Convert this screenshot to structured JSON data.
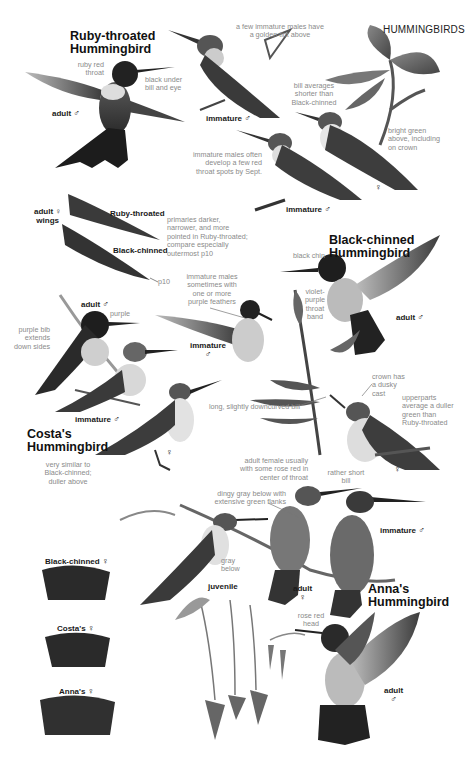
{
  "page": {
    "header": "HUMMINGBIRDS"
  },
  "species": {
    "ruby_throated": {
      "title_line1": "Ruby-throated",
      "title_line2": "Hummingbird",
      "adult_male": {
        "label": "adult",
        "sex": "♂"
      },
      "immature_male_top": {
        "label": "immature",
        "sex": "♂"
      },
      "immature_male_mid": {
        "label": "immature",
        "sex": "♂"
      },
      "female": {
        "sex": "♀"
      },
      "notes": {
        "ruby_red_throat": [
          "ruby red",
          "throat"
        ],
        "black_under_bill": [
          "black under",
          "bill and eye"
        ],
        "golden_tint": [
          "a few immature males have",
          "a golden tint above"
        ],
        "bill_shorter": [
          "bill averages",
          "shorter than",
          "Black-chinned"
        ],
        "bright_green": [
          "bright green",
          "above, including",
          "on crown"
        ],
        "red_spots": [
          "immature males often",
          "develop a few red",
          "throat spots by Sept."
        ]
      }
    },
    "wings": {
      "label_line1": "adult ♀",
      "label_line2": "wings",
      "ruby_label": "Ruby-throated",
      "black_label": "Black-chinned",
      "p10": "p10",
      "note": [
        "primaries darker,",
        "narrower, and more",
        "pointed in Ruby-throated;",
        "compare especially",
        "outermost p10"
      ]
    },
    "black_chinned": {
      "title_line1": "Black-chinned",
      "title_line2": "Hummingbird",
      "adult_male": {
        "label": "adult",
        "sex": "♂"
      },
      "immature_male": {
        "label": "immature",
        "sex": "♂"
      },
      "female": {
        "sex": "♀"
      },
      "notes": {
        "black_chin": "black chin",
        "violet_band": [
          "violet-",
          "purple",
          "throat",
          "band"
        ],
        "purple_feathers": [
          "immature males",
          "sometimes with",
          "one or more",
          "purple feathers"
        ],
        "downcurved_bill": "long, slightly downcurved bill",
        "crown_dusky": [
          "crown has",
          "a dusky",
          "cast"
        ],
        "upperparts": [
          "upperparts",
          "average a duller",
          "green than",
          "Ruby-throated"
        ]
      }
    },
    "costas": {
      "title_line1": "Costa's",
      "title_line2": "Hummingbird",
      "adult_male": {
        "label": "adult",
        "sex": "♂"
      },
      "immature_male": {
        "label": "immature",
        "sex": "♂"
      },
      "female": {
        "sex": "♀"
      },
      "notes": {
        "purple": "purple",
        "purple_bib": [
          "purple bib",
          "extends",
          "down sides"
        ],
        "similar": [
          "very similar to",
          "Black-chinned;",
          "duller above"
        ]
      }
    },
    "annas": {
      "title_line1": "Anna's",
      "title_line2": "Hummingbird",
      "adult_female": {
        "label": "adult",
        "sex": "♀"
      },
      "immature_male": {
        "label": "immature",
        "sex": "♂"
      },
      "juvenile": {
        "label": "juvenile"
      },
      "adult_male": {
        "label": "adult",
        "sex": "♂"
      },
      "notes": {
        "rose_red_center": [
          "adult female usually",
          "with some rose red in",
          "center of throat"
        ],
        "short_bill": [
          "rather short",
          "bill"
        ],
        "dingy_gray": [
          "dingy gray below with",
          "extensive green flanks"
        ],
        "gray_below": [
          "gray",
          "below"
        ],
        "rose_red_head": [
          "rose red",
          "head"
        ]
      }
    }
  },
  "tails": [
    {
      "label": "Black-chinned",
      "sex": "♀"
    },
    {
      "label": "Costa's",
      "sex": "♀"
    },
    {
      "label": "Anna's",
      "sex": "♀"
    }
  ],
  "colors": {
    "ink": "#111111",
    "note": "#8a8a8a",
    "bird_dark": "#2a2a2a",
    "bird_mid": "#6a6a6a",
    "bird_light": "#d8d8d8"
  }
}
